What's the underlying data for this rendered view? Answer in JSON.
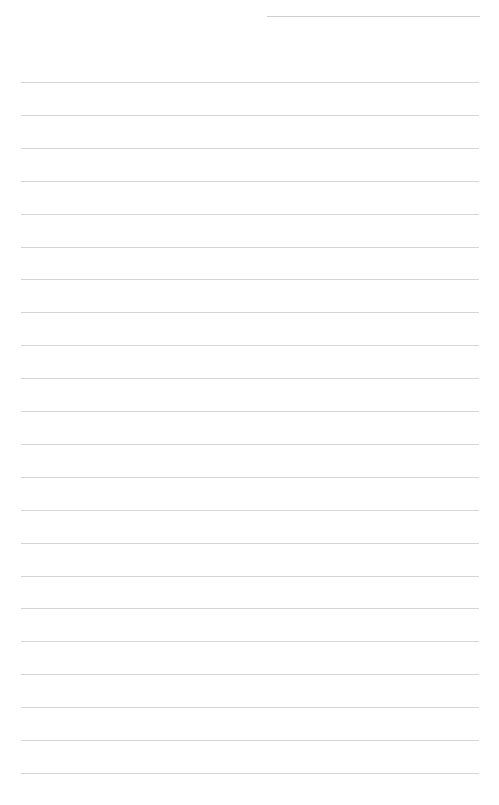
{
  "document": {
    "type": "blank lined paper",
    "background_color": "#ffffff",
    "rule_color": "#d4d4d4",
    "header_line": {
      "x_start": 267,
      "x_end": 480,
      "y": 16
    },
    "body_lines": {
      "x_start": 21,
      "x_end": 479,
      "first_y": 82,
      "spacing": 32.9,
      "count": 22
    }
  }
}
